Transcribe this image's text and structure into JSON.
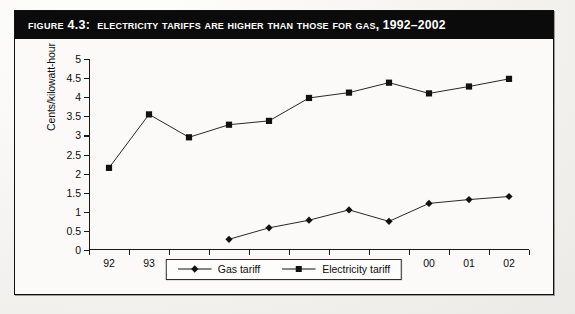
{
  "figure": {
    "number_label": "Figure 4.3:",
    "title": "Electricity Tariffs are Higher Than Those for Gas, 1992–2002"
  },
  "legend": {
    "position": "bottom-center",
    "items": [
      {
        "label": "Gas tariff",
        "marker": "diamond-marker",
        "color": "#111111"
      },
      {
        "label": "Electricity tariff",
        "marker": "square-marker",
        "color": "#111111"
      }
    ]
  },
  "chart_data": {
    "type": "line",
    "title": "Electricity Tariffs are Higher Than Those for Gas, 1992–2002",
    "xlabel": "",
    "ylabel": "Cents/kilowatt-hour",
    "categories": [
      "92",
      "93",
      "94",
      "95",
      "96",
      "97",
      "98",
      "99",
      "00",
      "01",
      "02"
    ],
    "ylim": [
      0,
      5
    ],
    "ytick_step": 0.5,
    "yticks": [
      "0",
      "0.5",
      "1",
      "1.5",
      "2",
      "2.5",
      "3",
      "3.5",
      "4",
      "4.5",
      "5"
    ],
    "grid": false,
    "legend_position": "bottom-center",
    "series": [
      {
        "name": "Gas tariff",
        "marker": "diamond",
        "color": "#111111",
        "values": [
          null,
          null,
          null,
          0.28,
          0.58,
          0.78,
          1.05,
          0.75,
          1.22,
          1.32,
          1.4
        ]
      },
      {
        "name": "Electricity tariff",
        "marker": "square",
        "color": "#111111",
        "values": [
          2.15,
          3.55,
          2.95,
          3.28,
          3.38,
          3.98,
          4.12,
          4.38,
          4.1,
          4.28,
          4.48
        ]
      }
    ]
  }
}
